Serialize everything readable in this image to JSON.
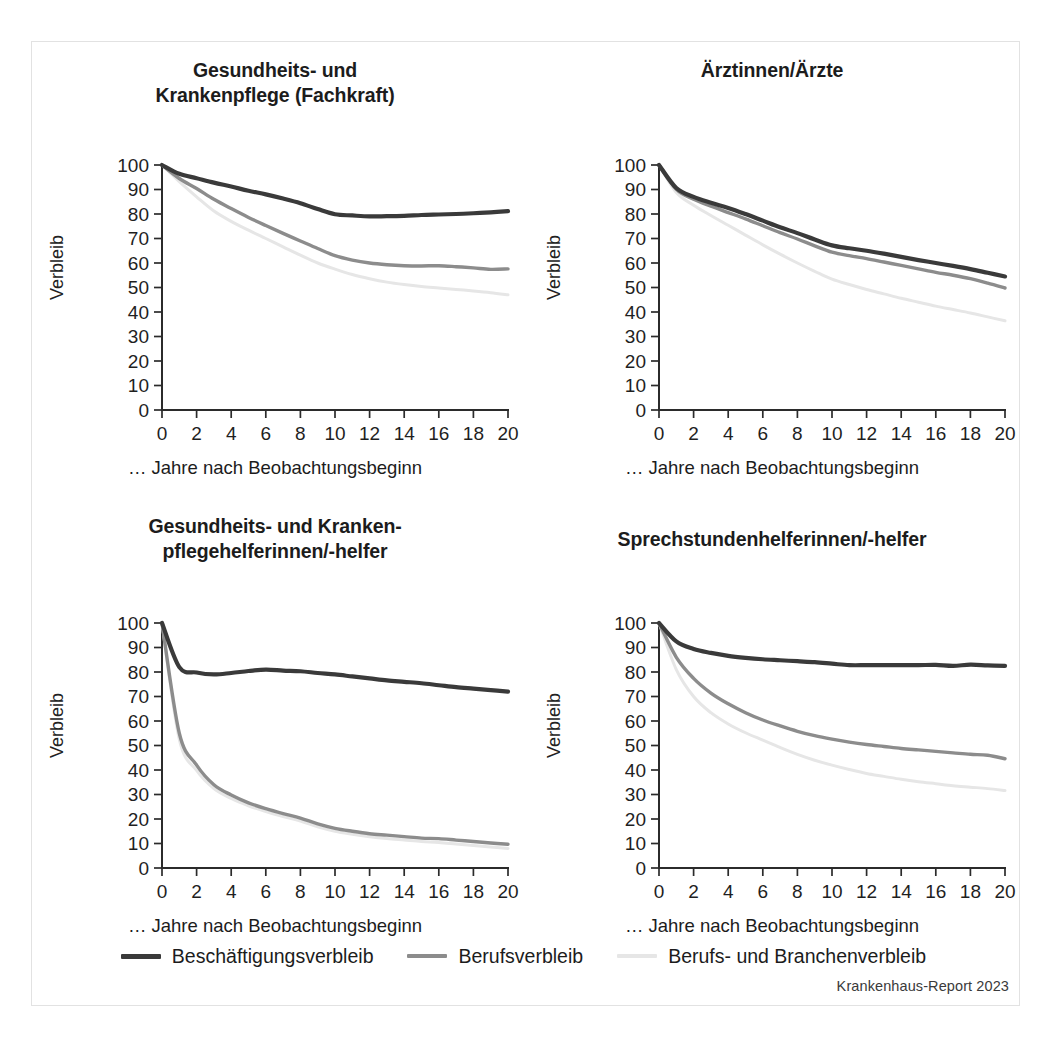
{
  "figure": {
    "source_credit": "Krankenhaus-Report 2023",
    "ylabel": "Verbleib",
    "xlabel": "… Jahre nach Beobachtungsbeginn",
    "yticks": [
      "0",
      "10",
      "20",
      "30",
      "40",
      "50",
      "60",
      "70",
      "80",
      "90",
      "100"
    ],
    "xticks": [
      "0",
      "2",
      "4",
      "6",
      "8",
      "10",
      "12",
      "14",
      "16",
      "18",
      "20"
    ]
  },
  "legend": {
    "position": "bottom-center",
    "items": [
      {
        "label": "Beschäftigungsverbleib",
        "color": "#3a3a3a"
      },
      {
        "label": "Berufsverbleib",
        "color": "#8c8c8c"
      },
      {
        "label": "Berufs- und Branchenverbleib",
        "color": "#e6e6e6"
      }
    ]
  },
  "colors": {
    "beschaeftigungsverbleib": "#3a3a3a",
    "berufsverbleib": "#8c8c8c",
    "berufs_und_branchenverbleib": "#e6e6e6",
    "axis": "#2b2b2b",
    "frame": "#e2e2e2",
    "background": "#ffffff"
  },
  "chart_data": [
    {
      "id": "gesundheits-und-krankenpflege-fachkraft",
      "type": "line",
      "title": "Gesundheits- und\nKrankenpflege (Fachkraft)",
      "title_lines": [
        "Gesundheits- und",
        "Krankenpflege (Fachkraft)"
      ],
      "xlabel": "… Jahre nach Beobachtungsbeginn",
      "ylabel": "Verbleib",
      "xlim": [
        0,
        20
      ],
      "ylim": [
        0,
        100
      ],
      "grid": false,
      "x": [
        0,
        1,
        2,
        3,
        4,
        5,
        6,
        7,
        8,
        9,
        10,
        11,
        12,
        13,
        14,
        15,
        16,
        17,
        18,
        19,
        20
      ],
      "series": [
        {
          "name": "Beschäftigungsverbleib",
          "color": "#3a3a3a",
          "values": [
            100.0,
            96.4,
            94.6,
            92.8,
            91.2,
            89.5,
            88.0,
            86.3,
            84.4,
            82.0,
            79.9,
            79.4,
            79.0,
            79.1,
            79.2,
            79.6,
            79.8,
            80.0,
            80.3,
            80.7,
            81.2
          ]
        },
        {
          "name": "Berufsverbleib",
          "color": "#8c8c8c",
          "values": [
            100.0,
            94.5,
            90.4,
            86.0,
            82.2,
            78.6,
            75.3,
            72.1,
            69.0,
            65.9,
            63.0,
            61.2,
            60.0,
            59.3,
            58.9,
            58.8,
            58.9,
            58.5,
            58.0,
            57.4,
            57.6
          ]
        },
        {
          "name": "Berufs- und Branchenverbleib",
          "color": "#e6e6e6",
          "values": [
            100.0,
            93.2,
            87.0,
            81.2,
            77.0,
            73.4,
            70.0,
            66.6,
            63.2,
            60.0,
            57.5,
            55.3,
            53.6,
            52.2,
            51.2,
            50.4,
            49.8,
            49.2,
            48.6,
            47.9,
            47.0
          ]
        }
      ]
    },
    {
      "id": "aerztinnen-aerzte",
      "type": "line",
      "title": "Ärztinnen/Ärzte",
      "title_lines": [
        "Ärztinnen/Ärzte"
      ],
      "xlabel": "… Jahre nach Beobachtungsbeginn",
      "ylabel": "Verbleib",
      "xlim": [
        0,
        20
      ],
      "ylim": [
        0,
        100
      ],
      "grid": false,
      "x": [
        0,
        1,
        2,
        3,
        4,
        5,
        6,
        7,
        8,
        9,
        10,
        11,
        12,
        13,
        14,
        15,
        16,
        17,
        18,
        19,
        20
      ],
      "series": [
        {
          "name": "Beschäftigungsverbleib",
          "color": "#3a3a3a",
          "values": [
            100.0,
            90.6,
            87.0,
            84.6,
            82.5,
            80.0,
            77.3,
            74.6,
            72.2,
            69.6,
            67.2,
            66.0,
            65.0,
            63.8,
            62.5,
            61.2,
            60.0,
            58.8,
            57.5,
            56.0,
            54.5
          ]
        },
        {
          "name": "Berufsverbleib",
          "color": "#8c8c8c",
          "values": [
            100.0,
            90.1,
            86.0,
            83.2,
            80.6,
            78.0,
            75.2,
            72.4,
            69.8,
            67.0,
            64.4,
            63.0,
            61.8,
            60.4,
            59.0,
            57.6,
            56.2,
            55.0,
            53.6,
            51.8,
            49.8
          ]
        },
        {
          "name": "Berufs- und Branchenverbleib",
          "color": "#e6e6e6",
          "values": [
            100.0,
            88.8,
            83.6,
            79.4,
            75.4,
            71.4,
            67.4,
            63.6,
            60.0,
            56.6,
            53.4,
            51.2,
            49.2,
            47.4,
            45.6,
            44.0,
            42.4,
            41.0,
            39.6,
            38.0,
            36.4
          ]
        }
      ]
    },
    {
      "id": "gesundheits-und-krankenpflegehelferinnen-helfer",
      "type": "line",
      "title": "Gesundheits- und Kranken-\npflegehelferinnen/-helfer",
      "title_lines": [
        "Gesundheits- und Kranken-",
        "pflegehelferinnen/-helfer"
      ],
      "xlabel": "… Jahre nach Beobachtungsbeginn",
      "ylabel": "Verbleib",
      "xlim": [
        0,
        20
      ],
      "ylim": [
        0,
        100
      ],
      "grid": false,
      "x": [
        0,
        1,
        2,
        3,
        4,
        5,
        6,
        7,
        8,
        9,
        10,
        11,
        12,
        13,
        14,
        15,
        16,
        17,
        18,
        19,
        20
      ],
      "series": [
        {
          "name": "Beschäftigungsverbleib",
          "color": "#3a3a3a",
          "values": [
            100.0,
            82.0,
            79.8,
            79.0,
            79.6,
            80.4,
            81.0,
            80.6,
            80.3,
            79.6,
            79.0,
            78.2,
            77.4,
            76.6,
            76.0,
            75.4,
            74.6,
            73.8,
            73.2,
            72.6,
            72.0
          ]
        },
        {
          "name": "Berufsverbleib",
          "color": "#8c8c8c",
          "values": [
            100.0,
            55.0,
            42.0,
            34.0,
            29.8,
            26.6,
            24.2,
            22.2,
            20.4,
            18.0,
            16.2,
            15.0,
            14.0,
            13.4,
            12.8,
            12.2,
            12.0,
            11.4,
            10.8,
            10.2,
            9.7
          ]
        },
        {
          "name": "Berufs- und Branchenverbleib",
          "color": "#e6e6e6",
          "values": [
            100.0,
            52.5,
            39.8,
            32.4,
            28.4,
            25.4,
            23.0,
            21.0,
            19.2,
            16.8,
            15.0,
            13.8,
            12.8,
            12.0,
            11.4,
            10.8,
            10.4,
            9.8,
            9.2,
            8.6,
            8.0
          ]
        }
      ]
    },
    {
      "id": "sprechstundenhelferinnen-helfer",
      "type": "line",
      "title": "Sprechstundenhelferinnen/-helfer",
      "title_lines": [
        "Sprechstundenhelferinnen/-helfer"
      ],
      "xlabel": "… Jahre nach Beobachtungsbeginn",
      "ylabel": "Verbleib",
      "xlim": [
        0,
        20
      ],
      "ylim": [
        0,
        100
      ],
      "grid": false,
      "x": [
        0,
        1,
        2,
        3,
        4,
        5,
        6,
        7,
        8,
        9,
        10,
        11,
        12,
        13,
        14,
        15,
        16,
        17,
        18,
        19,
        20
      ],
      "series": [
        {
          "name": "Beschäftigungsverbleib",
          "color": "#3a3a3a",
          "values": [
            100.0,
            92.5,
            89.4,
            87.8,
            86.6,
            85.8,
            85.2,
            84.8,
            84.4,
            84.0,
            83.4,
            82.8,
            82.8,
            82.8,
            82.8,
            82.8,
            82.9,
            82.5,
            83.0,
            82.7,
            82.5
          ]
        },
        {
          "name": "Berufsverbleib",
          "color": "#8c8c8c",
          "values": [
            100.0,
            86.0,
            77.4,
            71.4,
            67.0,
            63.4,
            60.4,
            58.0,
            55.8,
            54.0,
            52.6,
            51.4,
            50.4,
            49.6,
            48.8,
            48.2,
            47.6,
            47.0,
            46.4,
            46.0,
            44.6
          ]
        },
        {
          "name": "Berufs- und Branchenverbleib",
          "color": "#e6e6e6",
          "values": [
            100.0,
            81.0,
            70.0,
            63.4,
            58.8,
            55.2,
            52.2,
            49.2,
            46.4,
            44.0,
            42.0,
            40.2,
            38.6,
            37.4,
            36.2,
            35.2,
            34.4,
            33.6,
            33.0,
            32.4,
            31.6
          ]
        }
      ]
    }
  ]
}
